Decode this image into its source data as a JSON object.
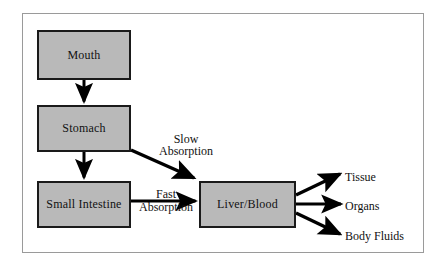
{
  "diagram": {
    "frame_border_color": "#9a9a9a",
    "node_fill_color": "#b9b9b9",
    "node_border_color": "#1a1a1a",
    "arrow_color": "#000000",
    "nodes": [
      {
        "id": "mouth",
        "label": "Mouth"
      },
      {
        "id": "stomach",
        "label": "Stomach"
      },
      {
        "id": "intestine",
        "label": "Small Intestine"
      },
      {
        "id": "liver",
        "label": "Liver/Blood"
      }
    ],
    "edge_labels": {
      "slow_line1": "Slow",
      "slow_line2": "Absorption",
      "fast_line1": "Fast",
      "fast_line2": "Absorption"
    },
    "outputs": [
      {
        "id": "tissue",
        "label": "Tissue"
      },
      {
        "id": "organs",
        "label": "Organs"
      },
      {
        "id": "body-fluids",
        "label": "Body  Fluids"
      }
    ],
    "edges": [
      {
        "from": "mouth",
        "to": "stomach",
        "label": ""
      },
      {
        "from": "stomach",
        "to": "intestine",
        "label": ""
      },
      {
        "from": "stomach",
        "to": "liver",
        "label": "Slow Absorption"
      },
      {
        "from": "intestine",
        "to": "liver",
        "label": "Fast Absorption"
      },
      {
        "from": "liver",
        "to": "tissue",
        "label": ""
      },
      {
        "from": "liver",
        "to": "organs",
        "label": ""
      },
      {
        "from": "liver",
        "to": "body-fluids",
        "label": ""
      }
    ]
  }
}
